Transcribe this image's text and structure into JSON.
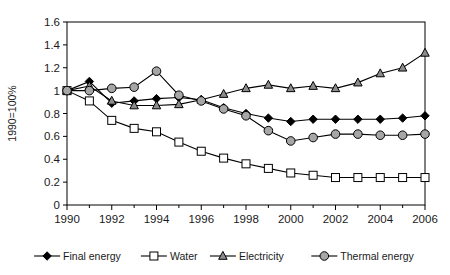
{
  "chart_data": {
    "type": "line",
    "title": "",
    "subtitle": "",
    "xlabel": "",
    "ylabel": "1990=100%",
    "x": [
      1990,
      1991,
      1992,
      1993,
      1994,
      1995,
      1996,
      1997,
      1998,
      1999,
      2000,
      2001,
      2002,
      2003,
      2004,
      2005,
      2006
    ],
    "xlim": [
      1990,
      2006
    ],
    "ylim": [
      0,
      1.6
    ],
    "x_tick_labels": [
      "1990",
      "1992",
      "1994",
      "1996",
      "1998",
      "2000",
      "2002",
      "2004",
      "2006"
    ],
    "x_tick_values": [
      1990,
      1992,
      1994,
      1996,
      1998,
      2000,
      2002,
      2004,
      2006
    ],
    "x_minor_tick_values": [
      1991,
      1993,
      1995,
      1997,
      1999,
      2001,
      2003,
      2005
    ],
    "y_tick_labels": [
      "0",
      "0.2",
      "0.4",
      "0.6",
      "0.8",
      "1",
      "1.2",
      "1.4",
      "1.6"
    ],
    "y_tick_values": [
      0,
      0.2,
      0.4,
      0.6,
      0.8,
      1.0,
      1.2,
      1.4,
      1.6
    ],
    "grid": false,
    "legend_position": "bottom",
    "series": [
      {
        "name": "Final energy",
        "marker": "filled-diamond",
        "color": "#000000",
        "values": [
          1.0,
          1.08,
          0.89,
          0.91,
          0.93,
          0.94,
          0.92,
          0.85,
          0.8,
          0.76,
          0.73,
          0.75,
          0.75,
          0.75,
          0.75,
          0.76,
          0.78
        ]
      },
      {
        "name": "Water",
        "marker": "open-square",
        "color": "#ffffff",
        "values": [
          1.0,
          0.91,
          0.74,
          0.67,
          0.64,
          0.55,
          0.47,
          0.41,
          0.36,
          0.32,
          0.28,
          0.26,
          0.24,
          0.24,
          0.24,
          0.24,
          0.24
        ]
      },
      {
        "name": "Electricity",
        "marker": "filled-triangle",
        "color": "#8c8c8c",
        "values": [
          1.0,
          1.04,
          0.91,
          0.87,
          0.87,
          0.88,
          0.92,
          0.97,
          1.02,
          1.05,
          1.02,
          1.04,
          1.02,
          1.07,
          1.15,
          1.2,
          1.33
        ]
      },
      {
        "name": "Thermal energy",
        "marker": "filled-circle",
        "color": "#a6a6a6",
        "values": [
          1.0,
          1.0,
          1.02,
          1.03,
          1.17,
          0.96,
          0.91,
          0.84,
          0.78,
          0.65,
          0.56,
          0.59,
          0.62,
          0.62,
          0.61,
          0.61,
          0.62
        ]
      }
    ]
  },
  "legend": {
    "items": [
      {
        "label": "Final energy"
      },
      {
        "label": "Water"
      },
      {
        "label": "Electricity"
      },
      {
        "label": "Thermal energy"
      }
    ]
  },
  "axes": {
    "y_title": "1990=100%"
  }
}
